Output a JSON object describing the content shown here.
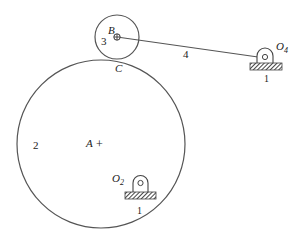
{
  "figure": {
    "type": "mechanism-diagram",
    "colors": {
      "stroke": "#444444",
      "text": "#222222",
      "hatch": "#555555",
      "background": "#ffffff"
    }
  },
  "labels": {
    "point_B": "B",
    "point_C": "C",
    "point_A": "A",
    "plus": "+",
    "body_2": "2",
    "body_3": "3",
    "link_4": "4",
    "pivot_O4_main": "O",
    "pivot_O4_sub": "4",
    "pivot_O2_main": "O",
    "pivot_O2_sub": "2",
    "ground_1_right": "1",
    "ground_1_bottom": "1"
  },
  "geometry": {
    "large_circle": {
      "cx": 101,
      "cy": 144,
      "r": 84
    },
    "small_circle": {
      "cx": 117,
      "cy": 37,
      "r": 22
    },
    "link_4": {
      "x1": 117,
      "y1": 37,
      "x2": 265,
      "y2": 58
    },
    "pivot_O4": {
      "cx": 265,
      "cy": 58
    },
    "pivot_O2": {
      "cx": 140,
      "cy": 182
    }
  }
}
